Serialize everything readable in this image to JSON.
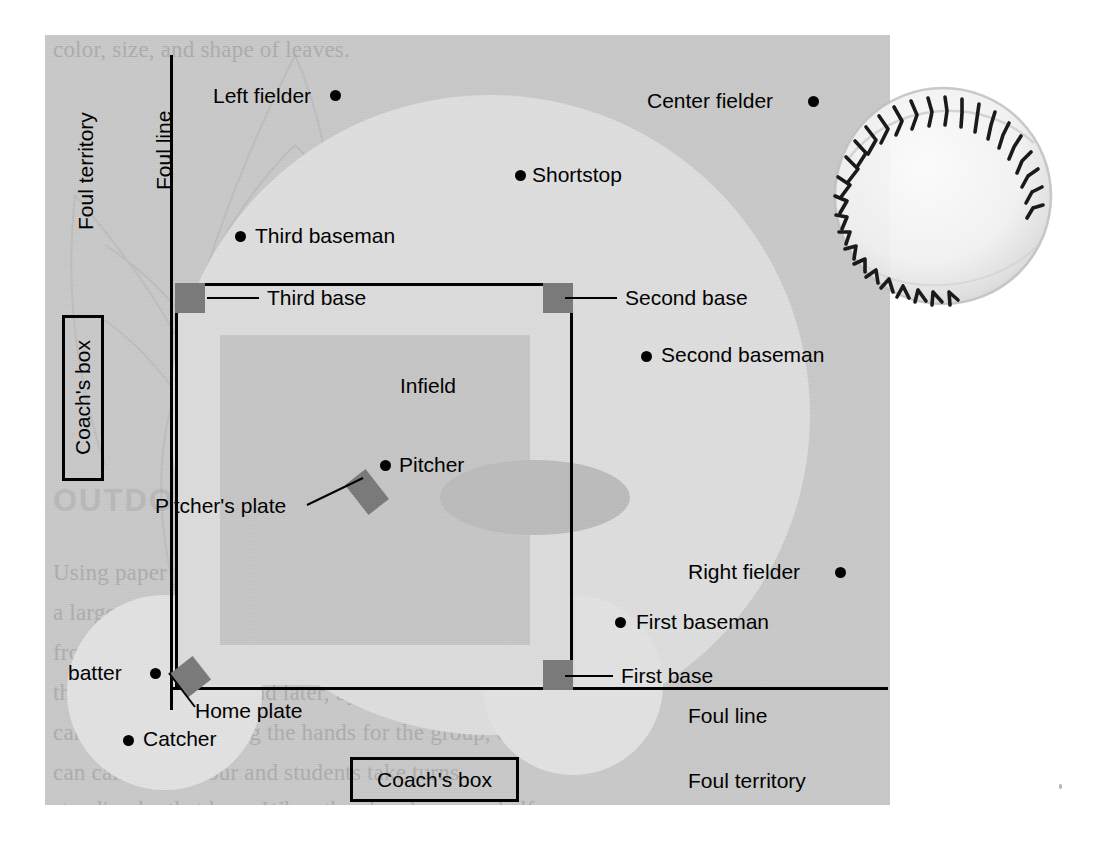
{
  "diagram": {
    "type": "baseball-field-diagram"
  },
  "field": {
    "foul_line_left": "Foul line",
    "foul_line_right": "Foul line",
    "foul_territory_left": "Foul territory",
    "foul_territory_right": "Foul territory",
    "infield": "Infield",
    "coachs_box_left": "Coach's box",
    "coachs_box_bottom": "Coach's box"
  },
  "bases": [
    {
      "id": "third-base",
      "label": "Third base"
    },
    {
      "id": "second-base",
      "label": "Second base"
    },
    {
      "id": "first-base",
      "label": "First base"
    },
    {
      "id": "home-plate",
      "label": "Home plate"
    },
    {
      "id": "pitchers-plate",
      "label": "Pitcher's plate"
    }
  ],
  "positions": [
    {
      "id": "left-fielder",
      "label": "Left fielder"
    },
    {
      "id": "center-fielder",
      "label": "Center fielder"
    },
    {
      "id": "shortstop",
      "label": "Shortstop"
    },
    {
      "id": "third-baseman",
      "label": "Third baseman"
    },
    {
      "id": "second-baseman",
      "label": "Second baseman"
    },
    {
      "id": "right-fielder",
      "label": "Right fielder"
    },
    {
      "id": "first-baseman",
      "label": "First baseman"
    },
    {
      "id": "pitcher",
      "label": "Pitcher"
    },
    {
      "id": "catcher",
      "label": "Catcher"
    },
    {
      "id": "batter",
      "label": "batter"
    }
  ],
  "background_text": {
    "heading": "OUTDOOR TIME",
    "top_line": "color, size, and shape of leaves.",
    "line1": "Using paper plates numbered from 1–12, make",
    "line2": "a large clock on the playground. Make large clock hands",
    "line3": "from cardboard. Move the hands. Have the students tell",
    "line4": "the time to the hour and later, by the half hour. Students",
    "line5": "can take turns moving the hands for the group, or you",
    "line6": "can call out an hour and students take turns",
    "line7": "standing by that hour. When the class becomes half",
    "right_col": [
      "w",
      "ue",
      "ndles of",
      "u can also h",
      "ulars accor",
      "da",
      "ca",
      "ac",
      "su",
      "4t",
      "fr",
      "w",
      "A",
      "st",
      "ca",
      "th"
    ]
  },
  "colors": {
    "panel_bg": "#c9c9c9",
    "outfield": "#dedede",
    "infield_dirt": "#c6c6c6",
    "base_marker": "#7a7a7a",
    "line": "#000000",
    "page_bg": "#ffffff"
  },
  "baseball": {
    "name": "baseball",
    "seam_count": 30
  }
}
